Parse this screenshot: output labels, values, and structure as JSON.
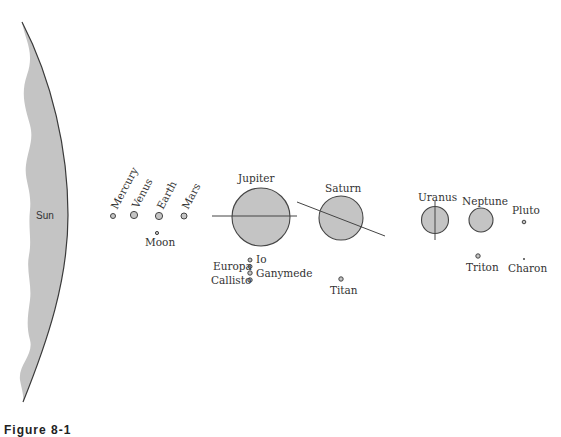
{
  "diagram": {
    "fill_color": "#c4c4c4",
    "stroke_color": "#444444",
    "sun": {
      "label": "Sun"
    },
    "inner_planets": [
      {
        "name": "Mercury",
        "x": 113,
        "y": 216,
        "r": 2.5
      },
      {
        "name": "Venus",
        "x": 134,
        "y": 215,
        "r": 3.5
      },
      {
        "name": "Earth",
        "x": 159,
        "y": 216,
        "r": 3.5
      },
      {
        "name": "Mars",
        "x": 184,
        "y": 216,
        "r": 3
      }
    ],
    "earth_moons": [
      {
        "name": "Moon",
        "x": 157,
        "y": 233,
        "r": 1.5
      }
    ],
    "outer_planets": [
      {
        "name": "Jupiter",
        "x": 261,
        "y": 217,
        "r": 29
      },
      {
        "name": "Saturn",
        "x": 341,
        "y": 218,
        "r": 22
      },
      {
        "name": "Uranus",
        "x": 435,
        "y": 220,
        "r": 13.5
      },
      {
        "name": "Neptune",
        "x": 481,
        "y": 220,
        "r": 12
      },
      {
        "name": "Pluto",
        "x": 524,
        "y": 222,
        "r": 1.8
      }
    ],
    "jupiter_moons": [
      {
        "name": "Io",
        "x": 250,
        "y": 260,
        "r": 2
      },
      {
        "name": "Europa",
        "x": 250,
        "y": 266,
        "r": 2
      },
      {
        "name": "Ganymede",
        "x": 250,
        "y": 273,
        "r": 2.2
      },
      {
        "name": "Callisto",
        "x": 250,
        "y": 280,
        "r": 2.2
      }
    ],
    "saturn_moons": [
      {
        "name": "Titan",
        "x": 341,
        "y": 279,
        "r": 2.2
      }
    ],
    "neptune_moons": [
      {
        "name": "Triton",
        "x": 478,
        "y": 256,
        "r": 2.2
      }
    ],
    "pluto_moons": [
      {
        "name": "Charon",
        "x": 524,
        "y": 259,
        "r": 1
      }
    ],
    "caption": "Figure 8-1"
  }
}
